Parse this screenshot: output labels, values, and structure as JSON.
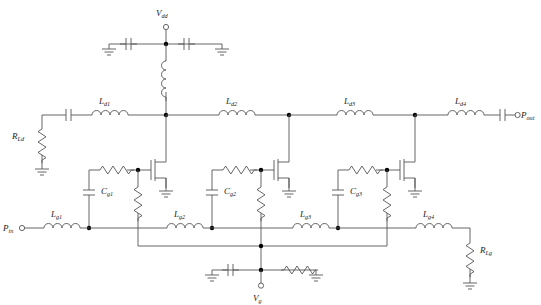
{
  "diagram": {
    "type": "circuit-schematic",
    "line_color": "#555555",
    "node_color": "#000000",
    "text_color": "#222222"
  },
  "terminals": {
    "vdd": {
      "base": "V",
      "sub": "dd"
    },
    "vg": {
      "base": "V",
      "sub": "g"
    },
    "pin": {
      "base": "P",
      "sub": "in"
    },
    "pout": {
      "base": "P",
      "sub": "out"
    }
  },
  "drain_line": {
    "inductors": [
      {
        "base": "L",
        "sub": "d1"
      },
      {
        "base": "L",
        "sub": "d2"
      },
      {
        "base": "L",
        "sub": "d3"
      },
      {
        "base": "L",
        "sub": "d4"
      }
    ],
    "termination_resistor": {
      "base": "R",
      "sub": "Ld"
    }
  },
  "gate_line": {
    "inductors": [
      {
        "base": "L",
        "sub": "g1"
      },
      {
        "base": "L",
        "sub": "g2"
      },
      {
        "base": "L",
        "sub": "g3"
      },
      {
        "base": "L",
        "sub": "g4"
      }
    ],
    "termination_resistor": {
      "base": "R",
      "sub": "Lg"
    }
  },
  "stages": [
    {
      "cap": {
        "base": "C",
        "sub": "g1"
      }
    },
    {
      "cap": {
        "base": "C",
        "sub": "g2"
      }
    },
    {
      "cap": {
        "base": "C",
        "sub": "g3"
      }
    }
  ],
  "components": {
    "transistor_count": 3,
    "ground_symbols": 11,
    "dc_block_caps": 2,
    "bypass_caps": 2,
    "rf_choke": 1
  }
}
